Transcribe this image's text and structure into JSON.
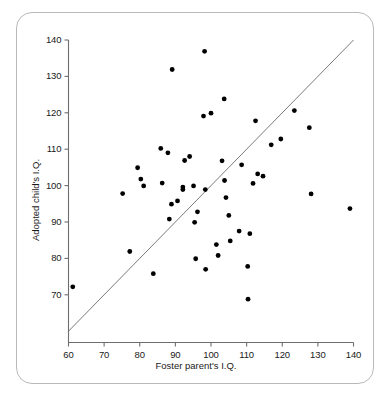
{
  "chart_data": {
    "type": "scatter",
    "title": "",
    "xlabel": "Foster parent's I.Q.",
    "ylabel": "Adopted child's I.Q.",
    "xlim": [
      60,
      140
    ],
    "ylim": [
      60,
      140
    ],
    "xticks": [
      60,
      70,
      80,
      90,
      100,
      110,
      120,
      130,
      140
    ],
    "yticks": [
      70,
      80,
      90,
      100,
      110,
      120,
      130,
      140
    ],
    "grid": false,
    "legend": null,
    "point_color": "#000000",
    "line_color": "#6b6b6b",
    "frame_color": "#b9b9b9",
    "reference_line": {
      "description": "y = x identity line",
      "x": [
        60,
        140
      ],
      "y": [
        60,
        140
      ]
    },
    "points": [
      {
        "x": 61.2,
        "y": 72.2
      },
      {
        "x": 75.2,
        "y": 97.8
      },
      {
        "x": 77.2,
        "y": 81.9
      },
      {
        "x": 79.4,
        "y": 104.9
      },
      {
        "x": 80.3,
        "y": 101.8
      },
      {
        "x": 81.1,
        "y": 99.9
      },
      {
        "x": 83.8,
        "y": 75.8
      },
      {
        "x": 85.9,
        "y": 110.2
      },
      {
        "x": 86.3,
        "y": 100.7
      },
      {
        "x": 87.9,
        "y": 109.0
      },
      {
        "x": 88.3,
        "y": 90.8
      },
      {
        "x": 88.9,
        "y": 94.9
      },
      {
        "x": 89.1,
        "y": 131.9
      },
      {
        "x": 90.6,
        "y": 95.8
      },
      {
        "x": 92.1,
        "y": 99.6
      },
      {
        "x": 92.1,
        "y": 98.9
      },
      {
        "x": 92.6,
        "y": 106.9
      },
      {
        "x": 94.0,
        "y": 108.0
      },
      {
        "x": 95.1,
        "y": 99.9
      },
      {
        "x": 95.4,
        "y": 89.9
      },
      {
        "x": 95.7,
        "y": 79.9
      },
      {
        "x": 96.2,
        "y": 92.8
      },
      {
        "x": 97.9,
        "y": 119.1
      },
      {
        "x": 98.2,
        "y": 136.9
      },
      {
        "x": 98.4,
        "y": 98.9
      },
      {
        "x": 98.5,
        "y": 77.0
      },
      {
        "x": 100.0,
        "y": 119.9
      },
      {
        "x": 101.5,
        "y": 83.8
      },
      {
        "x": 102.0,
        "y": 80.8
      },
      {
        "x": 103.1,
        "y": 106.8
      },
      {
        "x": 103.7,
        "y": 123.8
      },
      {
        "x": 103.8,
        "y": 101.4
      },
      {
        "x": 104.2,
        "y": 96.7
      },
      {
        "x": 105.0,
        "y": 91.8
      },
      {
        "x": 105.4,
        "y": 84.8
      },
      {
        "x": 107.9,
        "y": 87.5
      },
      {
        "x": 108.6,
        "y": 105.7
      },
      {
        "x": 110.3,
        "y": 77.8
      },
      {
        "x": 110.4,
        "y": 68.8
      },
      {
        "x": 110.9,
        "y": 86.8
      },
      {
        "x": 111.8,
        "y": 100.6
      },
      {
        "x": 112.5,
        "y": 117.8
      },
      {
        "x": 113.1,
        "y": 103.2
      },
      {
        "x": 114.6,
        "y": 102.6
      },
      {
        "x": 116.9,
        "y": 111.2
      },
      {
        "x": 119.6,
        "y": 112.8
      },
      {
        "x": 123.4,
        "y": 120.6
      },
      {
        "x": 127.6,
        "y": 115.9
      },
      {
        "x": 128.1,
        "y": 97.7
      },
      {
        "x": 139.0,
        "y": 93.7
      }
    ]
  }
}
